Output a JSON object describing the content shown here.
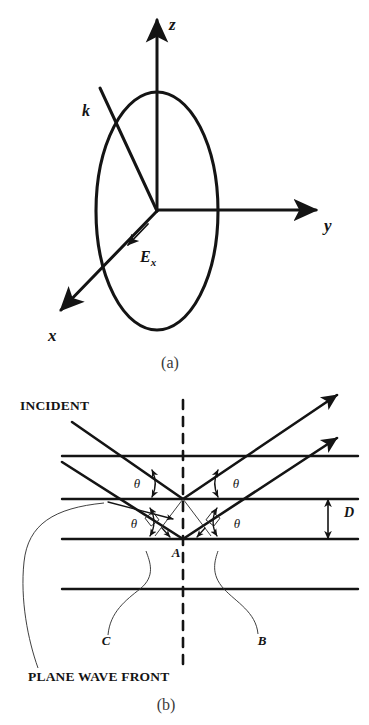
{
  "figure": {
    "background_color": "#ffffff",
    "ink_color": "#141414"
  },
  "panel_a": {
    "caption": "(a)",
    "description": "Right-handed coordinate axes x, y, z with a circular wavefront disc in the x-z plane, propagation vector k and field vector E_x",
    "axes": [
      {
        "name": "z-axis",
        "label": "z",
        "direction": "up"
      },
      {
        "name": "y-axis",
        "label": "y",
        "direction": "right"
      },
      {
        "name": "x-axis",
        "label": "x",
        "direction": "down-left"
      }
    ],
    "vectors": [
      {
        "name": "wave-vector",
        "label": "k",
        "description": "propagation direction arrow pointing down-right toward origin"
      },
      {
        "name": "field-vector",
        "label_base": "E",
        "label_sub": "x",
        "description": "electric field arrow along negative x direction"
      }
    ],
    "disc": {
      "name": "wavefront-ellipse",
      "shape": "ellipse",
      "center": [
        157,
        211
      ],
      "rx": 61,
      "ry": 119
    }
  },
  "panel_b": {
    "caption": "(b)",
    "description": "Plane wave incident on a parallel-sided film showing reflection at two interfaces separated by thickness D",
    "labels": {
      "incident": "INCIDENT",
      "plane_wave_front": "PLANE WAVE FRONT",
      "point_a": "A",
      "point_b": "B",
      "point_c": "C",
      "thickness": "D"
    },
    "angles": [
      {
        "name": "theta-incident-upper",
        "label": "θ"
      },
      {
        "name": "theta-reflected-upper",
        "label": "θ"
      },
      {
        "name": "theta-incident-lower",
        "label": "θ"
      },
      {
        "name": "theta-reflected-lower",
        "label": "θ"
      }
    ],
    "interfaces": [
      {
        "name": "interface-line-1",
        "y": 456
      },
      {
        "name": "interface-line-2",
        "y": 499
      },
      {
        "name": "interface-line-3",
        "y": 539
      },
      {
        "name": "interface-line-4",
        "y": 589
      }
    ],
    "normal": {
      "name": "normal-dashed-line",
      "style": "dashed",
      "x": 183
    }
  }
}
